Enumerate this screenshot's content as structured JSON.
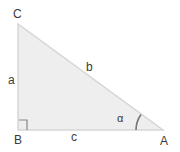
{
  "diagram": {
    "type": "right-triangle",
    "vertices": [
      {
        "id": "C",
        "label": "C"
      },
      {
        "id": "B",
        "label": "B"
      },
      {
        "id": "A",
        "label": "A"
      }
    ],
    "sides": [
      {
        "id": "a",
        "label": "a",
        "between": [
          "B",
          "C"
        ]
      },
      {
        "id": "b",
        "label": "b",
        "between": [
          "C",
          "A"
        ]
      },
      {
        "id": "c",
        "label": "c",
        "between": [
          "B",
          "A"
        ]
      }
    ],
    "angle": {
      "label": "α",
      "at": "A"
    },
    "right_angle_at": "B",
    "colors": {
      "fill": "#eeeeee",
      "stroke": "#d4d4d4",
      "arc": "#777777",
      "text": "#3a3a3a"
    }
  }
}
